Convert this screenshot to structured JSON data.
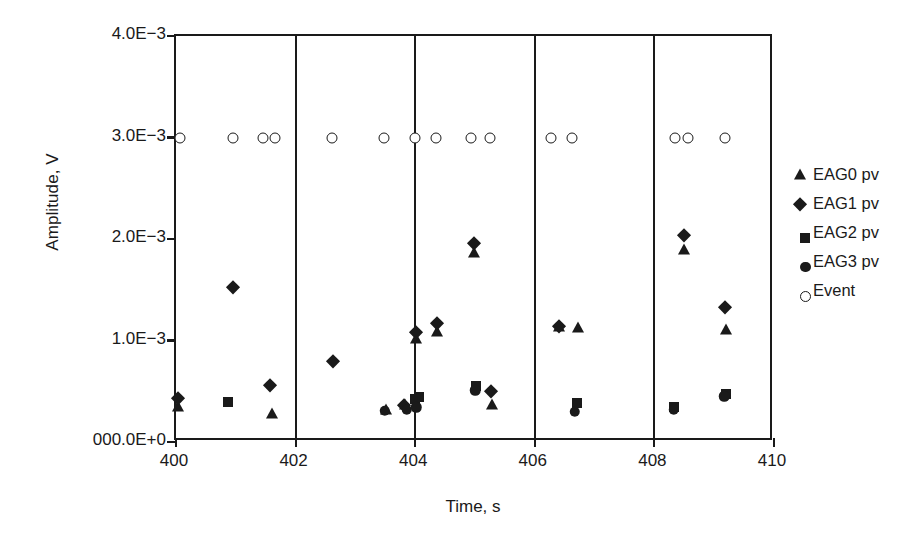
{
  "chart_data": {
    "type": "scatter",
    "title": "",
    "xlabel": "Time, s",
    "ylabel": "Amplitude, V",
    "xlim": [
      400,
      410
    ],
    "ylim": [
      0,
      0.004
    ],
    "xticks": [
      "400",
      "402",
      "404",
      "406",
      "408",
      "410"
    ],
    "xtick_values": [
      400,
      402,
      404,
      406,
      408,
      410
    ],
    "yticks": [
      "000.0E+0",
      "1.0E−3",
      "2.0E−3",
      "3.0E−3",
      "4.0E−3"
    ],
    "ytick_values": [
      0,
      0.001,
      0.002,
      0.003,
      0.004
    ],
    "grid": "vertical-only",
    "gridlines_x": [
      402,
      404,
      406,
      408
    ],
    "legend_position": "right",
    "series": [
      {
        "name": "EAG0 pv",
        "marker": "triangle",
        "color": "#1a1a1a",
        "points": [
          [
            400.03,
            0.00034
          ],
          [
            401.6,
            0.00028
          ],
          [
            403.52,
            0.00032
          ],
          [
            403.83,
            0.00036
          ],
          [
            404.02,
            0.00101
          ],
          [
            404.36,
            0.00108
          ],
          [
            404.99,
            0.00186
          ],
          [
            405.29,
            0.00036
          ],
          [
            406.4,
            0.00113
          ],
          [
            406.73,
            0.00112
          ],
          [
            408.5,
            0.00189
          ],
          [
            409.19,
            0.0011
          ]
        ]
      },
      {
        "name": "EAG1 pv",
        "marker": "diamond",
        "color": "#1a1a1a",
        "points": [
          [
            400.03,
            0.00043
          ],
          [
            400.95,
            0.00153
          ],
          [
            401.58,
            0.00056
          ],
          [
            402.62,
            0.0008
          ],
          [
            403.82,
            0.00036
          ],
          [
            404.02,
            0.00108
          ],
          [
            404.36,
            0.00117
          ],
          [
            404.99,
            0.00196
          ],
          [
            405.27,
            0.0005
          ],
          [
            406.41,
            0.00114
          ],
          [
            408.5,
            0.00204
          ],
          [
            409.18,
            0.00133
          ]
        ]
      },
      {
        "name": "EAG2 pv",
        "marker": "square",
        "color": "#1a1a1a",
        "points": [
          [
            400.87,
            0.00039
          ],
          [
            403.99,
            0.00042
          ],
          [
            404.07,
            0.00044
          ],
          [
            405.02,
            0.00055
          ],
          [
            406.7,
            0.00038
          ],
          [
            408.33,
            0.00034
          ],
          [
            409.19,
            0.00047
          ]
        ]
      },
      {
        "name": "EAG3 pv",
        "marker": "circle",
        "color": "#1a1a1a",
        "points": [
          [
            403.49,
            0.00031
          ],
          [
            403.86,
            0.00032
          ],
          [
            404.02,
            0.00034
          ],
          [
            405.0,
            0.00051
          ],
          [
            406.67,
            0.0003
          ],
          [
            408.32,
            0.00032
          ],
          [
            409.17,
            0.00045
          ]
        ]
      },
      {
        "name": "Event",
        "marker": "open-circle",
        "color": "#1a1a1a",
        "points": [
          [
            400.07,
            0.003
          ],
          [
            400.95,
            0.003
          ],
          [
            401.45,
            0.003
          ],
          [
            401.66,
            0.003
          ],
          [
            402.61,
            0.003
          ],
          [
            403.47,
            0.003
          ],
          [
            404.0,
            0.003
          ],
          [
            404.34,
            0.003
          ],
          [
            404.94,
            0.003
          ],
          [
            405.25,
            0.003
          ],
          [
            406.27,
            0.003
          ],
          [
            406.63,
            0.003
          ],
          [
            408.34,
            0.003
          ],
          [
            408.56,
            0.003
          ],
          [
            409.18,
            0.003
          ]
        ]
      }
    ]
  },
  "legend": {
    "items": [
      {
        "label": "EAG0 pv",
        "marker": "triangle"
      },
      {
        "label": "EAG1 pv",
        "marker": "diamond"
      },
      {
        "label": "EAG2 pv",
        "marker": "square"
      },
      {
        "label": "EAG3 pv",
        "marker": "circle"
      },
      {
        "label": "Event",
        "marker": "open-circle"
      }
    ]
  }
}
